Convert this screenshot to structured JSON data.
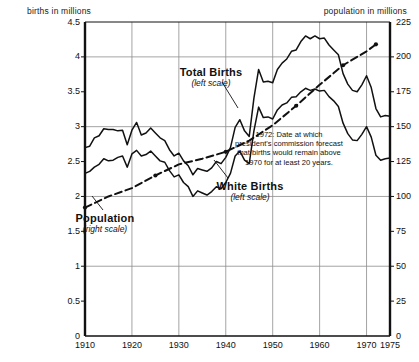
{
  "chart_data": {
    "type": "line",
    "title": "",
    "xlabel": "",
    "ylabel": "births in millions",
    "y2label": "population in millions",
    "grid": true,
    "legend_position": "inline-annotations",
    "xlim": [
      1910,
      1975
    ],
    "ylim": [
      0,
      4.5
    ],
    "y2lim": [
      0,
      225
    ],
    "xticks": [
      "1910",
      "1920",
      "1930",
      "1940",
      "1950",
      "1960",
      "1970",
      "1975"
    ],
    "xtick_values": [
      1910,
      1920,
      1930,
      1940,
      1950,
      1960,
      1970,
      1975
    ],
    "yticks": [
      "0",
      "0.5",
      "1",
      "1.5",
      "2",
      "2.5",
      "3",
      "3.5",
      "4",
      "4.5"
    ],
    "ytick_values": [
      0,
      0.5,
      1,
      1.5,
      2,
      2.5,
      3,
      3.5,
      4,
      4.5
    ],
    "y2ticks": [
      "0",
      "25",
      "50",
      "75",
      "100",
      "125",
      "150",
      "175",
      "200",
      "225"
    ],
    "y2tick_values": [
      0,
      25,
      50,
      75,
      100,
      125,
      150,
      175,
      200,
      225
    ],
    "gridline_x_values": [
      1920,
      1930,
      1940,
      1950,
      1960,
      1970
    ],
    "gridline_y_values": [
      1,
      2,
      3,
      4
    ],
    "series": [
      {
        "name": "Total Births",
        "scale": "left",
        "style": "solid",
        "x": [
          1910,
          1911,
          1912,
          1913,
          1914,
          1915,
          1916,
          1917,
          1918,
          1919,
          1920,
          1921,
          1922,
          1923,
          1924,
          1925,
          1926,
          1927,
          1928,
          1929,
          1930,
          1931,
          1932,
          1933,
          1934,
          1935,
          1936,
          1937,
          1938,
          1939,
          1940,
          1941,
          1942,
          1943,
          1944,
          1945,
          1946,
          1947,
          1948,
          1949,
          1950,
          1951,
          1952,
          1953,
          1954,
          1955,
          1956,
          1957,
          1958,
          1959,
          1960,
          1961,
          1962,
          1963,
          1964,
          1965,
          1966,
          1967,
          1968,
          1969,
          1970,
          1971,
          1972,
          1973,
          1974,
          1975
        ],
        "values": [
          2.7,
          2.72,
          2.84,
          2.87,
          2.97,
          2.96,
          2.96,
          2.94,
          2.95,
          2.74,
          2.95,
          3.06,
          2.88,
          2.91,
          2.98,
          2.91,
          2.84,
          2.8,
          2.67,
          2.58,
          2.62,
          2.51,
          2.44,
          2.31,
          2.4,
          2.38,
          2.36,
          2.41,
          2.5,
          2.47,
          2.56,
          2.7,
          2.99,
          3.1,
          2.94,
          2.86,
          3.41,
          3.82,
          3.64,
          3.65,
          3.63,
          3.82,
          3.91,
          3.97,
          4.08,
          4.1,
          4.22,
          4.3,
          4.26,
          4.3,
          4.26,
          4.27,
          4.17,
          4.1,
          4.03,
          3.76,
          3.61,
          3.52,
          3.5,
          3.6,
          3.73,
          3.56,
          3.26,
          3.14,
          3.16,
          3.15
        ],
        "units": "millions"
      },
      {
        "name": "White Births",
        "scale": "left",
        "style": "solid",
        "x": [
          1910,
          1911,
          1912,
          1913,
          1914,
          1915,
          1916,
          1917,
          1918,
          1919,
          1920,
          1921,
          1922,
          1923,
          1924,
          1925,
          1926,
          1927,
          1928,
          1929,
          1930,
          1931,
          1932,
          1933,
          1934,
          1935,
          1936,
          1937,
          1938,
          1939,
          1940,
          1941,
          1942,
          1943,
          1944,
          1945,
          1946,
          1947,
          1948,
          1949,
          1950,
          1951,
          1952,
          1953,
          1954,
          1955,
          1956,
          1957,
          1958,
          1959,
          1960,
          1961,
          1962,
          1963,
          1964,
          1965,
          1966,
          1967,
          1968,
          1969,
          1970,
          1971,
          1972,
          1973,
          1974,
          1975
        ],
        "values": [
          2.33,
          2.36,
          2.42,
          2.46,
          2.54,
          2.51,
          2.52,
          2.56,
          2.58,
          2.42,
          2.61,
          2.66,
          2.58,
          2.6,
          2.65,
          2.58,
          2.51,
          2.49,
          2.37,
          2.28,
          2.31,
          2.2,
          2.14,
          2.0,
          2.08,
          2.05,
          2.02,
          2.07,
          2.14,
          2.11,
          2.2,
          2.33,
          2.58,
          2.65,
          2.52,
          2.47,
          2.94,
          3.28,
          3.13,
          3.14,
          3.11,
          3.24,
          3.31,
          3.34,
          3.42,
          3.43,
          3.5,
          3.55,
          3.52,
          3.54,
          3.51,
          3.52,
          3.43,
          3.37,
          3.29,
          3.05,
          2.9,
          2.81,
          2.8,
          2.89,
          3.0,
          2.85,
          2.59,
          2.52,
          2.54,
          2.55
        ],
        "units": "millions"
      },
      {
        "name": "Population",
        "scale": "right",
        "style": "dashed",
        "x": [
          1910,
          1915,
          1920,
          1925,
          1930,
          1935,
          1940,
          1945,
          1950,
          1955,
          1960,
          1965,
          1970,
          1972
        ],
        "values": [
          92,
          100,
          106,
          115,
          123,
          127,
          132,
          140,
          151,
          165,
          180,
          194,
          204,
          209
        ],
        "units": "millions",
        "markers_at_x": [
          1910,
          1925,
          1940,
          1955,
          1965,
          1972
        ]
      }
    ],
    "annotations": [
      {
        "target_x": 1972,
        "lines": [
          "1972: Date at which",
          "president's commission forecast",
          "that births would remain above",
          "1970 for at least 20 years."
        ]
      }
    ],
    "series_labels": [
      {
        "name": "Total Births",
        "scale_note": "(left scale)"
      },
      {
        "name": "White Births",
        "scale_note": "(left scale)"
      },
      {
        "name": "Population",
        "scale_note": "(right scale)"
      }
    ],
    "colors": {
      "line": "#111111",
      "grid": "#8d8d8d",
      "axis": "#111111",
      "background": "#ffffff"
    }
  }
}
